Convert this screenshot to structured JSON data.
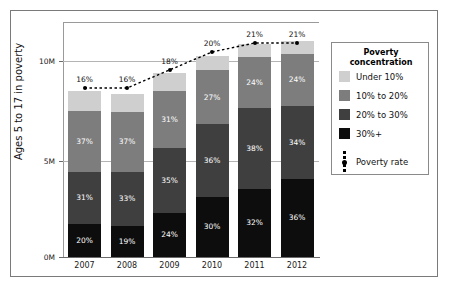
{
  "chart_data": {
    "type": "bar",
    "subtype": "stacked-bar-with-line",
    "title": "",
    "xlabel": "",
    "ylabel": "Ages 5 to 17 in poverty",
    "categories": [
      "2007",
      "2008",
      "2009",
      "2010",
      "2011",
      "2012"
    ],
    "ylim": [
      0,
      11.5
    ],
    "yticks": [
      0,
      5,
      10
    ],
    "ytick_labels": [
      "0M",
      "5M",
      "10M"
    ],
    "grid": true,
    "legend_position": "right",
    "legend_title": "Poverty concentration",
    "series": [
      {
        "name": "30%+",
        "color": "#0d0d0d",
        "values": [
          20,
          19,
          24,
          30,
          32,
          36
        ],
        "labels": [
          "20%",
          "19%",
          "24%",
          "30%",
          "32%",
          "36%"
        ]
      },
      {
        "name": "20% to 30%",
        "color": "#3f3f3f",
        "values": [
          31,
          33,
          35,
          36,
          38,
          34
        ],
        "labels": [
          "31%",
          "33%",
          "35%",
          "36%",
          "38%",
          "34%"
        ]
      },
      {
        "name": "10% to 20%",
        "color": "#7d7d7d",
        "values": [
          37,
          37,
          31,
          27,
          24,
          24
        ],
        "labels": [
          "37%",
          "37%",
          "31%",
          "27%",
          "24%",
          "24%"
        ]
      },
      {
        "name": "Under 10%",
        "color": "#cfcfcf",
        "values": [
          12,
          11,
          10,
          7,
          6,
          6
        ],
        "labels": [
          "",
          "",
          "",
          "",
          "",
          ""
        ]
      }
    ],
    "totals_millions": [
      8.47,
      8.32,
      9.39,
      10.25,
      10.85,
      11.0
    ],
    "line_series": {
      "name": "Poverty rate",
      "color": "#000000",
      "style": "dotted",
      "marker": "circle",
      "values": [
        16,
        16,
        18,
        20,
        21,
        21
      ],
      "labels": [
        "16%",
        "16%",
        "18%",
        "20%",
        "21%",
        "21%"
      ]
    }
  },
  "legend": {
    "title_line1": "Poverty",
    "title_line2": "concentration",
    "items": [
      {
        "label": "Under 10%",
        "color": "#cfcfcf"
      },
      {
        "label": "10% to 20%",
        "color": "#7d7d7d"
      },
      {
        "label": "20% to 30%",
        "color": "#3f3f3f"
      },
      {
        "label": "30%+",
        "color": "#0d0d0d"
      }
    ],
    "rate_label": "Poverty rate"
  },
  "axis": {
    "y_title": "Ages 5 to 17 in poverty",
    "y_ticks": [
      "10M",
      "5M",
      "0M"
    ],
    "x_ticks": [
      "2007",
      "2008",
      "2009",
      "2010",
      "2011",
      "2012"
    ]
  }
}
